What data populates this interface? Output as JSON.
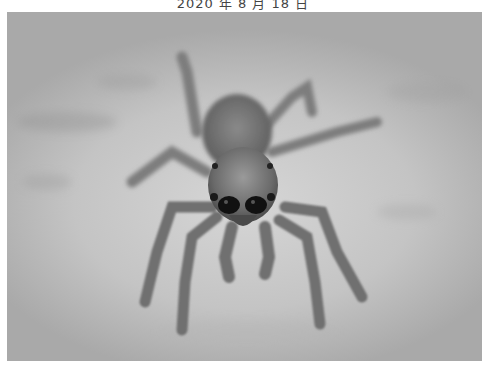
{
  "caption": {
    "text": "2020 年 8 月 18 日"
  },
  "photo": {
    "subject": "jumping spider",
    "description": "Grayscale macro photograph of a jumping spider facing the camera on a mottled light gray surface",
    "palette": {
      "background_light": "#d6d6d6",
      "background_dark": "#a9a9a9",
      "body": "#6e6e6e",
      "eyes": "#111111",
      "legs": "#7a7a7a"
    }
  }
}
